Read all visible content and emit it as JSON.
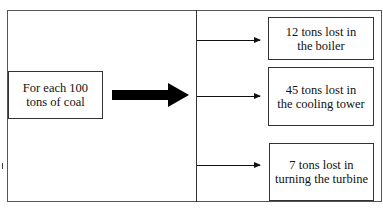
{
  "diagram": {
    "source": {
      "line1": "For each 100",
      "line2": "tons of coal"
    },
    "outputs": [
      {
        "line1": "12 tons lost in",
        "line2": "the boiler"
      },
      {
        "line1": "45 tons lost in",
        "line2": "the cooling tower"
      },
      {
        "line1": "7 tons lost in",
        "line2": "turning the turbine"
      }
    ]
  }
}
